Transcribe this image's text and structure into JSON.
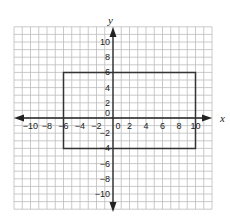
{
  "chart_data": {
    "type": "diagram",
    "title": "",
    "xlabel": "x",
    "ylabel": "y",
    "xlim": [
      -11,
      11
    ],
    "ylim": [
      -11,
      11
    ],
    "grid": true,
    "grid_step": 1,
    "x_ticks": [
      -10,
      -8,
      -6,
      -4,
      -2,
      0,
      2,
      4,
      6,
      8,
      10
    ],
    "x_tick_labels": [
      "−10",
      "−8",
      "−6",
      "−4",
      "−2",
      "0",
      "2",
      "4",
      "6",
      "8",
      "10"
    ],
    "y_ticks": [
      10,
      8,
      6,
      4,
      2,
      0,
      -2,
      -4,
      -6,
      -8,
      -10
    ],
    "y_tick_labels": [
      "10",
      "8",
      "6",
      "4",
      "2",
      "0",
      "−2",
      "−4",
      "−6",
      "−8",
      "−10"
    ],
    "shapes": [
      {
        "type": "rectangle",
        "vertices": [
          [
            -6,
            6
          ],
          [
            10,
            6
          ],
          [
            10,
            -4
          ],
          [
            -6,
            -4
          ]
        ],
        "stroke": "#333333"
      }
    ]
  },
  "colors": {
    "grid": "#bdbdbd",
    "axis": "#222222",
    "shape": "#333333",
    "background": "#ffffff"
  },
  "axis_labels": {
    "x": "x",
    "y": "y"
  }
}
